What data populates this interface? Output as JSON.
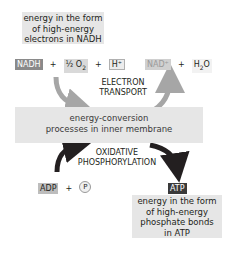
{
  "top_caption": {
    "lines": [
      "energy in the form",
      "of high-energy",
      "electrons in NADH"
    ]
  },
  "reactants": {
    "nadh": "NADH",
    "plus1": "+",
    "half_o2": "½ O",
    "o2_sub": "2",
    "plus2": "+",
    "h_plus": "H⁺"
  },
  "products": {
    "nad_plus": "NAD⁺",
    "plus": "+",
    "water": "H",
    "water_sub": "2",
    "water_tail": "O"
  },
  "electron_transport": {
    "lines": [
      "ELECTRON",
      "TRANSPORT"
    ]
  },
  "membrane_box": {
    "lines": [
      "energy-conversion",
      "processes in inner membrane"
    ]
  },
  "oxidative": {
    "lines": [
      "OXIDATIVE",
      "PHOSPHORYLATION"
    ]
  },
  "adp_group": {
    "adp": "ADP",
    "plus": "+",
    "phosphate": "P"
  },
  "atp": {
    "label": "ATP"
  },
  "bottom_caption": {
    "lines": [
      "energy in the form",
      "of high-energy",
      "phosphate bonds",
      "in ATP"
    ]
  },
  "colors": {
    "light_box": "#e6e6e6",
    "grey_arrow": "#a6a6a6",
    "black_arrow": "#231f20",
    "nadh_chip": "#8a8a8a",
    "atp_chip": "#3a3a3a"
  }
}
